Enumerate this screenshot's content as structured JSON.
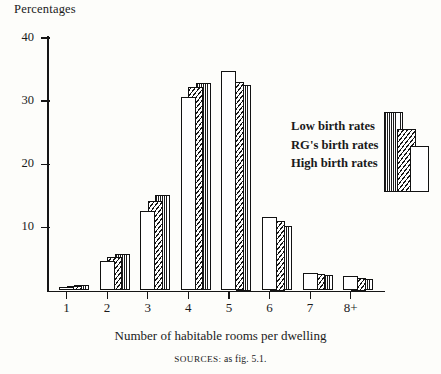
{
  "figure": {
    "y_axis_caption": "Percentages",
    "x_axis_title": "Number of habitable rooms per dwelling",
    "source_prefix": "SOURCES:",
    "source_text": " as fig. 5.1."
  },
  "legend": {
    "items": [
      {
        "label": "Low birth rates",
        "pattern": "dots",
        "color": "#1b1b1b"
      },
      {
        "label": "RG's birth rates",
        "pattern": "hatch",
        "color": "#171717"
      },
      {
        "label": "High birth rates",
        "pattern": "plain",
        "color": "#ffffff"
      }
    ]
  },
  "chart_data": {
    "type": "bar",
    "title": "",
    "subtitle": "",
    "xlabel": "Number of habitable rooms per dwelling",
    "ylabel": "Percentages",
    "categories": [
      "1",
      "2",
      "3",
      "4",
      "5",
      "6",
      "7",
      "8+"
    ],
    "series": [
      {
        "name": "High birth rates",
        "pattern": "plain",
        "values": [
          0.6,
          4.6,
          12.6,
          30.6,
          34.7,
          11.6,
          2.8,
          2.3
        ]
      },
      {
        "name": "RG's birth rates",
        "pattern": "hatch",
        "values": [
          0.7,
          5.3,
          14.2,
          32.2,
          33.1,
          11.0,
          2.6,
          2.0
        ]
      },
      {
        "name": "Low birth rates",
        "pattern": "dots",
        "values": [
          0.8,
          5.8,
          15.2,
          32.8,
          32.5,
          10.2,
          2.4,
          1.8
        ]
      }
    ],
    "ylim": [
      0,
      41
    ],
    "yticks": [
      10,
      20,
      30,
      40
    ],
    "ytick_labels": [
      "10",
      "20",
      "30",
      "40"
    ],
    "grid": false,
    "legend_position": "right",
    "source": "SOURCES: as fig. 5.1."
  }
}
